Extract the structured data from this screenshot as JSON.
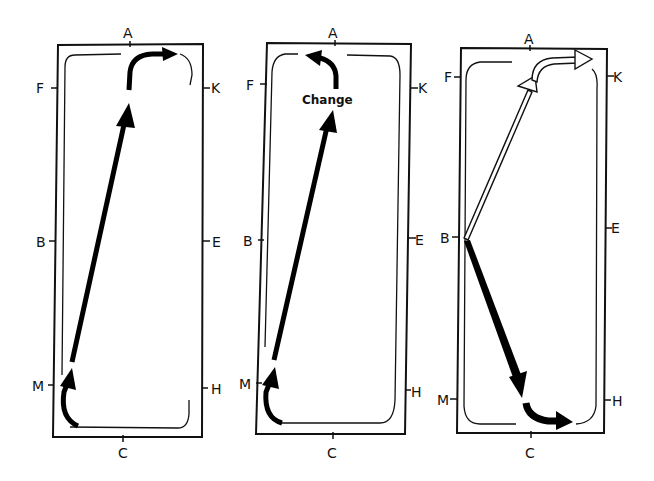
{
  "figure": {
    "type": "dressage arena movement diagrams",
    "panels": [
      {
        "id": "arena-1",
        "letters": {
          "top": "A",
          "left_upper": "F",
          "right_upper": "K",
          "left_mid": "B",
          "right_mid": "E",
          "left_lower": "M",
          "right_lower": "H",
          "bottom": "C"
        },
        "path": "Track from M across the diagonal to K, then along the A end"
      },
      {
        "id": "arena-2",
        "letters": {
          "top": "A",
          "left_upper": "F",
          "right_upper": "K",
          "left_mid": "B",
          "right_mid": "E",
          "left_lower": "M",
          "right_lower": "H",
          "bottom": "C"
        },
        "annotation": "Change",
        "path": "Track from M across the diagonal, change of rein, turn toward F"
      },
      {
        "id": "arena-3",
        "letters": {
          "top": "A",
          "left_upper": "F",
          "right_upper": "K",
          "left_mid": "B",
          "right_mid": "E",
          "left_lower": "M",
          "right_lower": "H",
          "bottom": "C"
        },
        "path": "From B: hollow arrow toward K via A end; solid arrow toward H via C end"
      }
    ]
  }
}
